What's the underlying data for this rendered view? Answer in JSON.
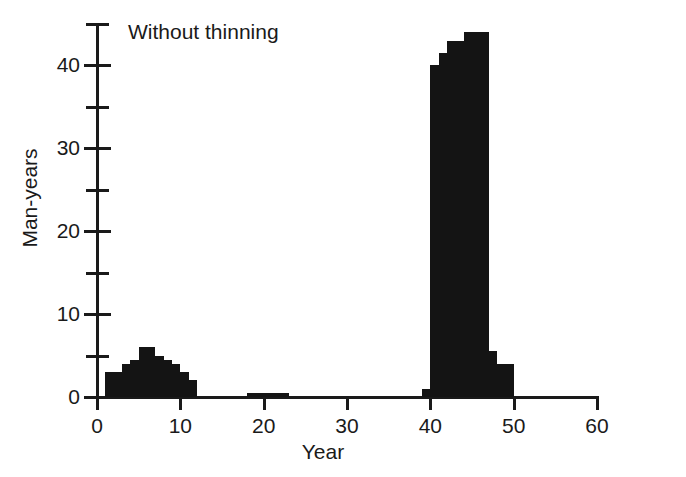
{
  "figure": {
    "annotation": "Without thinning",
    "background_color": "#ffffff",
    "bar_color": "#141414",
    "axis_color": "#1a1a1a"
  },
  "axes": {
    "y_title": "Man-years",
    "x_title": "Year",
    "y_major_labels": [
      "0",
      "10",
      "20",
      "30",
      "40"
    ],
    "x_major_labels": [
      "0",
      "10",
      "20",
      "30",
      "40",
      "50",
      "60"
    ]
  },
  "chart_data": {
    "type": "bar",
    "title": "Without thinning",
    "xlabel": "Year",
    "ylabel": "Man-years",
    "xlim": [
      0,
      60
    ],
    "ylim": [
      0,
      45
    ],
    "grid": false,
    "legend": null,
    "bin_width": 1,
    "x_ticks": [
      0,
      10,
      20,
      30,
      40,
      50,
      60
    ],
    "x_minor_ticks": [],
    "y_ticks": [
      0,
      10,
      20,
      30,
      40
    ],
    "y_minor_ticks": [
      5,
      15,
      25,
      35,
      45
    ],
    "annotations": [
      {
        "text": "Without thinning",
        "x": 6,
        "y": 44
      }
    ],
    "categories": [
      "1",
      "2",
      "3",
      "4",
      "5",
      "6",
      "7",
      "8",
      "9",
      "10",
      "11",
      "18",
      "19",
      "20",
      "21",
      "22",
      "23",
      "39",
      "40",
      "41",
      "42",
      "43",
      "44",
      "45",
      "46",
      "47",
      "48",
      "49"
    ],
    "values": [
      3,
      3,
      4,
      4.5,
      6,
      6,
      5,
      4.5,
      4,
      3,
      2,
      0.5,
      0.5,
      0.5,
      0.5,
      0.5,
      0.5,
      1,
      40,
      41.5,
      43,
      43,
      44,
      44,
      44,
      5.5,
      4,
      4
    ],
    "bars": [
      {
        "x0": 1,
        "x1": 2,
        "value": 3
      },
      {
        "x0": 2,
        "x1": 3,
        "value": 3
      },
      {
        "x0": 3,
        "x1": 4,
        "value": 4
      },
      {
        "x0": 4,
        "x1": 5,
        "value": 4.5
      },
      {
        "x0": 5,
        "x1": 6,
        "value": 6
      },
      {
        "x0": 6,
        "x1": 7,
        "value": 6
      },
      {
        "x0": 7,
        "x1": 8,
        "value": 5
      },
      {
        "x0": 8,
        "x1": 9,
        "value": 4.5
      },
      {
        "x0": 9,
        "x1": 10,
        "value": 4
      },
      {
        "x0": 10,
        "x1": 11,
        "value": 3
      },
      {
        "x0": 11,
        "x1": 12,
        "value": 2
      },
      {
        "x0": 18,
        "x1": 23,
        "value": 0.5
      },
      {
        "x0": 39,
        "x1": 40,
        "value": 1
      },
      {
        "x0": 40,
        "x1": 41,
        "value": 40
      },
      {
        "x0": 41,
        "x1": 42,
        "value": 41.5
      },
      {
        "x0": 42,
        "x1": 43,
        "value": 43
      },
      {
        "x0": 43,
        "x1": 44,
        "value": 43
      },
      {
        "x0": 44,
        "x1": 47,
        "value": 44
      },
      {
        "x0": 47,
        "x1": 48,
        "value": 5.5
      },
      {
        "x0": 48,
        "x1": 50,
        "value": 4
      }
    ]
  }
}
